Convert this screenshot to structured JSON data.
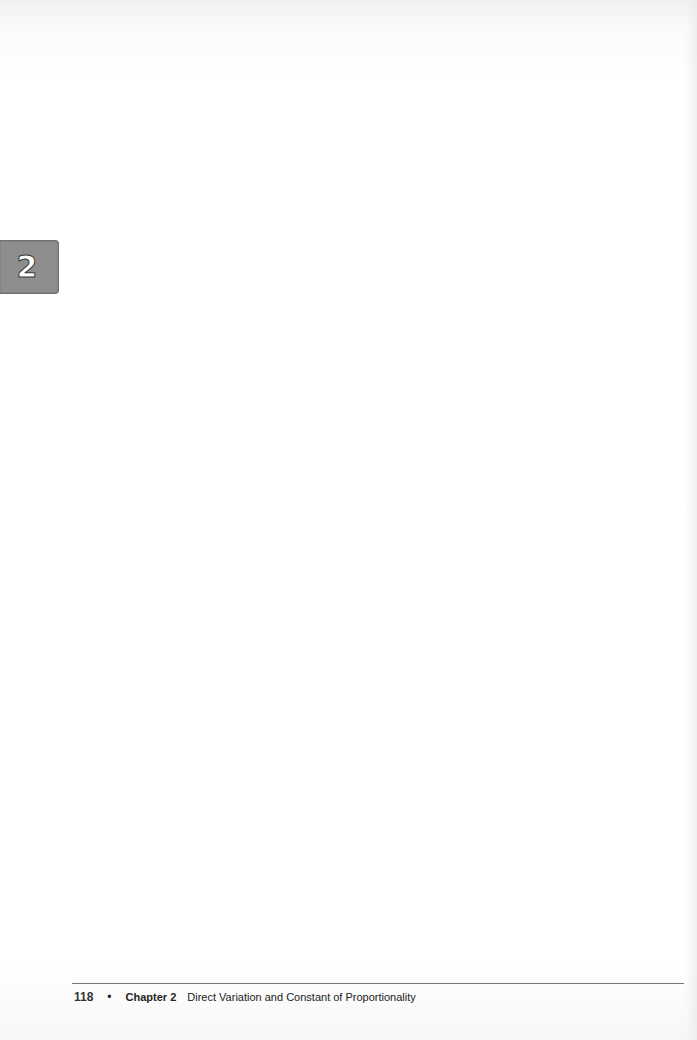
{
  "chapter_tab": {
    "number": "2",
    "background_color": "#8e8e8e"
  },
  "footer": {
    "page_number": "118",
    "separator": "•",
    "chapter_label": "Chapter 2",
    "chapter_title": "Direct Variation and Constant of Proportionality"
  },
  "body": {
    "content": ""
  }
}
